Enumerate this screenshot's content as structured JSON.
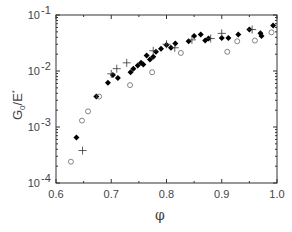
{
  "chart_data": {
    "type": "scatter",
    "title": "",
    "xlabel": "φ",
    "ylabel": "G0/E*",
    "xlim": [
      0.6,
      1.0
    ],
    "ylim": [
      0.0001,
      0.1
    ],
    "yscale": "log",
    "grid": false,
    "x_ticks": [
      "0.6",
      "0.7",
      "0.8",
      "0.9",
      "1.0"
    ],
    "y_ticks": [
      "10^-4",
      "10^-3",
      "10^-2",
      "10^-1"
    ],
    "series": [
      {
        "name": "filled diamonds",
        "marker": "filled",
        "points": [
          [
            0.637,
            0.00065
          ],
          [
            0.673,
            0.0035
          ],
          [
            0.694,
            0.0062
          ],
          [
            0.703,
            0.0085
          ],
          [
            0.712,
            0.0075
          ],
          [
            0.735,
            0.0095
          ],
          [
            0.74,
            0.011
          ],
          [
            0.748,
            0.0125
          ],
          [
            0.754,
            0.014
          ],
          [
            0.758,
            0.013
          ],
          [
            0.764,
            0.019
          ],
          [
            0.77,
            0.016
          ],
          [
            0.776,
            0.018
          ],
          [
            0.781,
            0.022
          ],
          [
            0.79,
            0.025
          ],
          [
            0.8,
            0.029
          ],
          [
            0.808,
            0.026
          ],
          [
            0.816,
            0.031
          ],
          [
            0.84,
            0.034
          ],
          [
            0.85,
            0.042
          ],
          [
            0.862,
            0.045
          ],
          [
            0.87,
            0.035
          ],
          [
            0.876,
            0.038
          ],
          [
            0.9,
            0.039
          ],
          [
            0.912,
            0.039
          ],
          [
            0.93,
            0.045
          ],
          [
            0.95,
            0.055
          ],
          [
            0.97,
            0.047
          ],
          [
            0.972,
            0.042
          ],
          [
            0.993,
            0.065
          ]
        ]
      },
      {
        "name": "open circles",
        "marker": "open",
        "points": [
          [
            0.627,
            0.00024
          ],
          [
            0.647,
            0.0013
          ],
          [
            0.658,
            0.0019
          ],
          [
            0.678,
            0.0035
          ],
          [
            0.734,
            0.0056
          ],
          [
            0.774,
            0.0095
          ],
          [
            0.826,
            0.021
          ],
          [
            0.91,
            0.022
          ],
          [
            0.928,
            0.034
          ],
          [
            0.96,
            0.035
          ],
          [
            0.99,
            0.049
          ]
        ]
      },
      {
        "name": "plus",
        "marker": "plus",
        "points": [
          [
            0.648,
            0.00038
          ],
          [
            0.7,
            0.0089
          ],
          [
            0.71,
            0.011
          ],
          [
            0.728,
            0.014
          ],
          [
            0.776,
            0.023
          ],
          [
            0.8,
            0.03
          ],
          [
            0.815,
            0.026
          ],
          [
            0.846,
            0.036
          ],
          [
            0.88,
            0.038
          ],
          [
            0.9,
            0.047
          ],
          [
            0.955,
            0.055
          ]
        ]
      }
    ]
  }
}
